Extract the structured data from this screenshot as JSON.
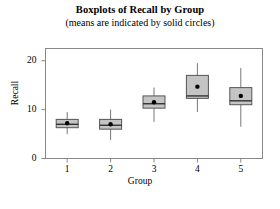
{
  "chart_data": {
    "type": "boxplot",
    "title": "Boxplots of Recall by Group",
    "subtitle": "(means are indicated by solid circles)",
    "xlabel": "Group",
    "ylabel": "Recall",
    "categories": [
      "1",
      "2",
      "3",
      "4",
      "5"
    ],
    "ylim": [
      0,
      22.5
    ],
    "yticks": [
      0,
      10,
      20
    ],
    "ytick_labels": [
      "0",
      "10",
      "20"
    ],
    "xtick_labels": [
      "1",
      "2",
      "3",
      "4",
      "5"
    ],
    "grid": false,
    "legend": null,
    "mean_marker": "solid circle",
    "box_fill_color": "#c4c4c4",
    "box_edge_color": "#555555",
    "whisker_color": "#777777",
    "median_color": "#333333",
    "mean_color": "#000000",
    "frame_color": "#888888",
    "boxes": [
      {
        "group": "1",
        "whisker_low": 5.0,
        "q1": 6.3,
        "median": 7.0,
        "q3": 8.0,
        "whisker_high": 9.5,
        "mean": 7.2
      },
      {
        "group": "2",
        "whisker_low": 3.8,
        "q1": 6.0,
        "median": 6.8,
        "q3": 8.0,
        "whisker_high": 10.0,
        "mean": 7.0
      },
      {
        "group": "3",
        "whisker_low": 7.5,
        "q1": 10.3,
        "median": 11.2,
        "q3": 12.8,
        "whisker_high": 14.5,
        "mean": 11.5
      },
      {
        "group": "4",
        "whisker_low": 9.5,
        "q1": 12.3,
        "median": 12.8,
        "q3": 17.0,
        "whisker_high": 19.5,
        "mean": 14.7
      },
      {
        "group": "5",
        "whisker_low": 6.5,
        "q1": 11.0,
        "median": 11.8,
        "q3": 14.5,
        "whisker_high": 18.5,
        "mean": 12.8
      }
    ]
  }
}
